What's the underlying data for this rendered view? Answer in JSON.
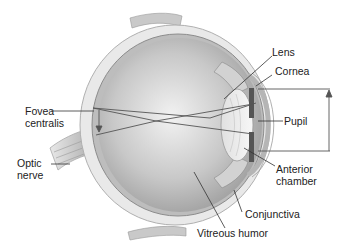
{
  "diagram": {
    "title": "",
    "labels": {
      "lens": "Lens",
      "cornea": "Cornea",
      "fovea_line1": "Fovea",
      "fovea_line2": "centralis",
      "pupil": "Pupil",
      "optic_line1": "Optic",
      "optic_line2": "nerve",
      "anterior_line1": "Anterior",
      "anterior_line2": "chamber",
      "conjunctiva": "Conjunctiva",
      "vitreous": "Vitreous humor"
    },
    "colors": {
      "background": "#ffffff",
      "eyeball_fill": "#cfcfcf",
      "sclera": "#e6e6e6",
      "outline": "#9a9a9a",
      "leader_line": "#333333",
      "text": "#222222"
    }
  }
}
